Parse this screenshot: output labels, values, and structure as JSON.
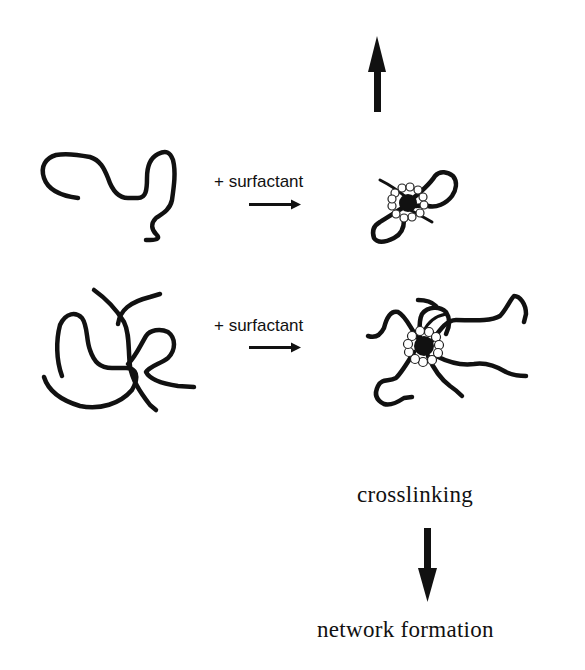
{
  "diagram": {
    "title": "",
    "rows": [
      {
        "id": "single-chain",
        "reagent_label": "+ surfactant",
        "before": "single polymer chain (coiled)",
        "after": "polymer chain with surfactant micelle at center"
      },
      {
        "id": "multiple-chains",
        "reagent_label": "+ surfactant",
        "before": "entangled multiple polymer chains",
        "after": "multiple chains bridged by surfactant micelle"
      }
    ],
    "process_label": "crosslinking",
    "result_label": "network formation",
    "arrows": {
      "top": "up-arrow",
      "reaction": "right-arrow",
      "bottom": "down-arrow"
    },
    "colors": {
      "ink": "#111111",
      "background": "#ffffff"
    }
  }
}
